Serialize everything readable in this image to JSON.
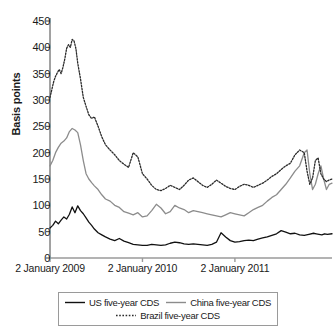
{
  "chart_data": {
    "type": "line",
    "title": "",
    "xlabel": "",
    "ylabel": "Basis points",
    "ylim": [
      0,
      450
    ],
    "ytick_values": [
      0,
      50,
      100,
      150,
      200,
      250,
      300,
      350,
      400,
      450
    ],
    "ytick_labels": [
      "0",
      "50",
      "100",
      "150",
      "200",
      "250",
      "300",
      "350",
      "400",
      "450"
    ],
    "xtick_labels": [
      "2 January 2009",
      "2 January 2010",
      "2 January 2011"
    ],
    "xtick_positions": [
      0,
      1,
      2
    ],
    "xlim": [
      0,
      3.05
    ],
    "grid": false,
    "legend_position": "bottom",
    "series": [
      {
        "name": "US five-year CDS",
        "color": "#111111",
        "style": "solid",
        "x": [
          0.0,
          0.03,
          0.06,
          0.09,
          0.12,
          0.15,
          0.18,
          0.21,
          0.24,
          0.27,
          0.3,
          0.33,
          0.36,
          0.39,
          0.42,
          0.45,
          0.48,
          0.52,
          0.56,
          0.6,
          0.65,
          0.7,
          0.75,
          0.8,
          0.85,
          0.9,
          0.95,
          1.0,
          1.05,
          1.1,
          1.15,
          1.2,
          1.25,
          1.3,
          1.35,
          1.4,
          1.45,
          1.5,
          1.55,
          1.6,
          1.65,
          1.7,
          1.75,
          1.8,
          1.85,
          1.9,
          1.95,
          2.0,
          2.05,
          2.1,
          2.15,
          2.2,
          2.25,
          2.3,
          2.35,
          2.4,
          2.45,
          2.5,
          2.55,
          2.6,
          2.65,
          2.7,
          2.75,
          2.8,
          2.85,
          2.88,
          2.91,
          2.94,
          2.97,
          3.0,
          3.05
        ],
        "values": [
          57,
          62,
          70,
          65,
          72,
          78,
          74,
          83,
          97,
          86,
          99,
          90,
          84,
          76,
          68,
          62,
          55,
          48,
          44,
          40,
          36,
          33,
          37,
          32,
          29,
          26,
          25,
          24,
          24,
          26,
          25,
          24,
          25,
          28,
          30,
          29,
          27,
          26,
          27,
          26,
          25,
          24,
          26,
          30,
          48,
          40,
          33,
          30,
          31,
          33,
          34,
          33,
          36,
          38,
          40,
          43,
          46,
          52,
          49,
          46,
          47,
          44,
          43,
          45,
          47,
          46,
          45,
          44,
          46,
          45,
          46
        ]
      },
      {
        "name": "China five-year CDS",
        "color": "#8c8c8c",
        "style": "solid",
        "x": [
          0.0,
          0.03,
          0.06,
          0.09,
          0.12,
          0.15,
          0.18,
          0.21,
          0.24,
          0.27,
          0.3,
          0.33,
          0.36,
          0.39,
          0.42,
          0.45,
          0.48,
          0.52,
          0.56,
          0.6,
          0.65,
          0.7,
          0.75,
          0.8,
          0.85,
          0.9,
          0.95,
          1.0,
          1.05,
          1.1,
          1.15,
          1.2,
          1.25,
          1.3,
          1.35,
          1.4,
          1.45,
          1.5,
          1.55,
          1.6,
          1.65,
          1.7,
          1.75,
          1.8,
          1.85,
          1.9,
          1.95,
          2.0,
          2.05,
          2.1,
          2.15,
          2.2,
          2.25,
          2.3,
          2.35,
          2.4,
          2.45,
          2.5,
          2.55,
          2.6,
          2.65,
          2.7,
          2.75,
          2.78,
          2.81,
          2.84,
          2.87,
          2.9,
          2.93,
          2.96,
          2.99,
          3.02,
          3.05
        ],
        "values": [
          175,
          185,
          200,
          210,
          218,
          222,
          228,
          240,
          246,
          243,
          238,
          215,
          185,
          160,
          150,
          143,
          137,
          130,
          120,
          112,
          108,
          100,
          96,
          88,
          85,
          82,
          86,
          78,
          80,
          90,
          102,
          95,
          84,
          88,
          100,
          95,
          92,
          86,
          90,
          88,
          86,
          84,
          82,
          80,
          78,
          82,
          86,
          84,
          82,
          80,
          86,
          92,
          96,
          100,
          108,
          115,
          120,
          130,
          140,
          152,
          165,
          175,
          200,
          205,
          160,
          130,
          140,
          160,
          175,
          150,
          130,
          140,
          142
        ]
      },
      {
        "name": "Brazil five-year CDS",
        "color": "#2b2b2b",
        "style": "dotted",
        "x": [
          0.0,
          0.02,
          0.04,
          0.06,
          0.08,
          0.1,
          0.12,
          0.14,
          0.16,
          0.18,
          0.2,
          0.22,
          0.24,
          0.26,
          0.28,
          0.3,
          0.33,
          0.36,
          0.39,
          0.42,
          0.45,
          0.48,
          0.52,
          0.56,
          0.6,
          0.65,
          0.7,
          0.75,
          0.8,
          0.85,
          0.9,
          0.95,
          1.0,
          1.05,
          1.1,
          1.15,
          1.2,
          1.25,
          1.3,
          1.35,
          1.4,
          1.45,
          1.5,
          1.55,
          1.6,
          1.65,
          1.7,
          1.75,
          1.8,
          1.85,
          1.9,
          1.95,
          2.0,
          2.05,
          2.1,
          2.15,
          2.2,
          2.25,
          2.3,
          2.35,
          2.4,
          2.45,
          2.5,
          2.55,
          2.6,
          2.65,
          2.7,
          2.75,
          2.78,
          2.81,
          2.84,
          2.87,
          2.9,
          2.93,
          2.96,
          2.99,
          3.02,
          3.05
        ],
        "values": [
          305,
          320,
          335,
          345,
          352,
          358,
          350,
          362,
          378,
          398,
          405,
          400,
          415,
          412,
          398,
          370,
          340,
          305,
          288,
          272,
          265,
          268,
          250,
          230,
          215,
          205,
          196,
          185,
          178,
          172,
          200,
          192,
          160,
          150,
          138,
          130,
          128,
          132,
          138,
          134,
          130,
          138,
          148,
          152,
          145,
          138,
          134,
          140,
          148,
          142,
          136,
          132,
          130,
          136,
          140,
          138,
          134,
          138,
          142,
          148,
          155,
          160,
          168,
          175,
          180,
          196,
          205,
          200,
          165,
          140,
          152,
          185,
          190,
          160,
          150,
          145,
          148,
          150
        ]
      }
    ]
  },
  "legend": {
    "items": [
      {
        "label": "US five-year CDS"
      },
      {
        "label": "China five-year CDS"
      },
      {
        "label": "Brazil five-year CDS"
      }
    ]
  }
}
